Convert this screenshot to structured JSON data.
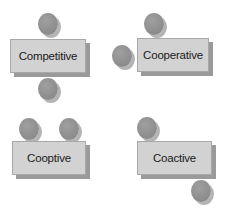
{
  "diagram": {
    "type": "interaction-styles",
    "colors": {
      "box_fill": "#d2d2d2",
      "box_shadow": "#9a9a9a",
      "circle_fill": "#8e8e8e",
      "text": "#1a1a1a"
    },
    "panels": [
      {
        "label": "Competitive",
        "circles": [
          "top",
          "bottom"
        ]
      },
      {
        "label": "Cooperative",
        "circles": [
          "top",
          "left"
        ]
      },
      {
        "label": "Cooptive",
        "circles": [
          "top-left",
          "top-right"
        ]
      },
      {
        "label": "Coactive",
        "circles": [
          "top-left",
          "bottom-right"
        ]
      }
    ]
  }
}
